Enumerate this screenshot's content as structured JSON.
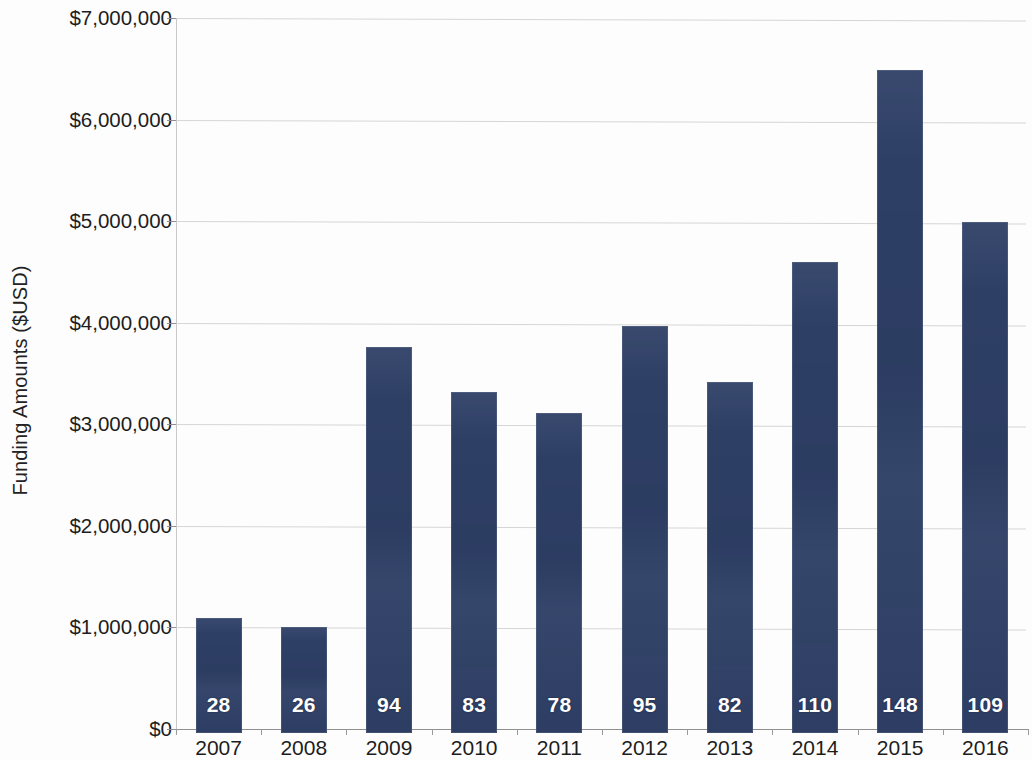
{
  "chart_data": {
    "type": "bar",
    "title": "",
    "xlabel": "",
    "ylabel": "Funding Amounts ($USD)",
    "categories": [
      "2007",
      "2008",
      "2009",
      "2010",
      "2011",
      "2012",
      "2013",
      "2014",
      "2015",
      "2016"
    ],
    "values": [
      1130000,
      1040000,
      3800000,
      3360000,
      3150000,
      4010000,
      3460000,
      4640000,
      6530000,
      5030000
    ],
    "bar_labels": [
      "28",
      "26",
      "94",
      "83",
      "78",
      "95",
      "82",
      "110",
      "148",
      "109"
    ],
    "bar_label_meaning": "number of awards shown in white inside each bar",
    "ylim": [
      0,
      7000000
    ],
    "ytick_values": [
      0,
      1000000,
      2000000,
      3000000,
      4000000,
      5000000,
      6000000,
      7000000
    ],
    "ytick_labels": [
      "$0",
      "$1,000,000",
      "$2,000,000",
      "$3,000,000",
      "$4,000,000",
      "$5,000,000",
      "$6,000,000",
      "$7,000,000"
    ],
    "grid": true,
    "legend": "none",
    "series": [
      {
        "name": "Funding Amounts ($USD)",
        "values": [
          1130000,
          1040000,
          3800000,
          3360000,
          3150000,
          4010000,
          3460000,
          4640000,
          6530000,
          5030000
        ]
      }
    ],
    "colors": {
      "bar": "#2e3f66",
      "gridline": "#d6d6d6",
      "axis": "#8f8f8f",
      "text": "#1d1d1d",
      "bar_label_text": "#ffffff",
      "background": "#fdfdfd"
    }
  }
}
